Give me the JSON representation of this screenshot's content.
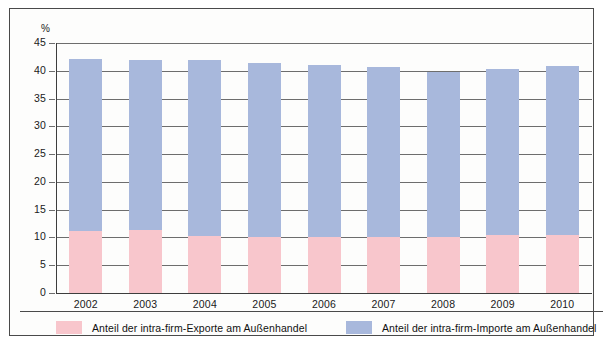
{
  "chart_data": {
    "type": "bar",
    "stacked": true,
    "title": "",
    "subtitle": "",
    "xlabel": "",
    "ylabel": "%",
    "unit_label": "%",
    "categories": [
      "2002",
      "2003",
      "2004",
      "2005",
      "2006",
      "2007",
      "2008",
      "2009",
      "2010"
    ],
    "ylim": [
      0,
      45
    ],
    "ytick_step": 5,
    "yticks": [
      "0",
      "5",
      "10",
      "15",
      "20",
      "25",
      "30",
      "35",
      "40",
      "45"
    ],
    "grid": true,
    "legend_position": "bottom",
    "series": [
      {
        "name": "Anteil der intra-firm-Exporte am Außenhandel",
        "key": "exports",
        "color": "#f8c6cc",
        "values": [
          11.1,
          11.3,
          10.2,
          10.1,
          10.0,
          10.1,
          10.0,
          10.5,
          10.4
        ]
      },
      {
        "name": "Anteil der intra-firm-Importe am Außenhandel",
        "key": "imports",
        "color": "#a8b8dc",
        "values": [
          31.0,
          30.6,
          31.7,
          31.3,
          31.1,
          30.6,
          29.8,
          29.8,
          30.4
        ]
      }
    ],
    "totals": [
      42.1,
      41.9,
      41.9,
      41.4,
      41.1,
      40.7,
      39.8,
      40.3,
      40.8
    ]
  },
  "legend": {
    "entries": [
      {
        "label": "Anteil der intra-firm-Exporte am Außenhandel",
        "color": "#f8c6cc"
      },
      {
        "label": "Anteil der intra-firm-Importe am Außenhandel",
        "color": "#a8b8dc"
      }
    ]
  },
  "colors": {
    "exports": "#f8c6cc",
    "imports": "#a8b8dc",
    "grid": "#6d6d6d",
    "axis": "#3d3d3d",
    "frame": "#4a4a4a",
    "text": "#1a1a1a",
    "background": "#fdfdfc"
  }
}
